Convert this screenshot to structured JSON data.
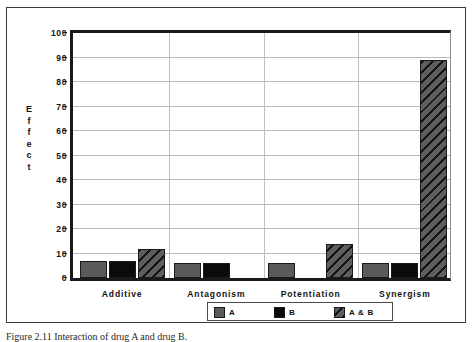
{
  "figure": {
    "caption": "Figure 2.11 Interaction of drug A and drug B."
  },
  "legend": {
    "position": "bottom-center",
    "items": [
      {
        "label": "A",
        "pattern": "solid-gray",
        "color": "#5a5a5a"
      },
      {
        "label": "B",
        "pattern": "solid-black",
        "color": "#0b0b0b"
      },
      {
        "label": "A & B",
        "pattern": "diagonal-hatch",
        "color": "#4a4a4a"
      }
    ]
  },
  "chart_data": {
    "type": "bar",
    "title": "",
    "xlabel": "",
    "ylabel": "Effect",
    "ylim": [
      0,
      100
    ],
    "yticks": [
      0,
      10,
      20,
      30,
      40,
      50,
      60,
      70,
      80,
      90,
      100
    ],
    "grid": true,
    "categories": [
      "Additive",
      "Antagonism",
      "Potentiation",
      "Synergism"
    ],
    "series": [
      {
        "name": "A",
        "values": [
          7,
          6,
          6,
          6
        ]
      },
      {
        "name": "B",
        "values": [
          7,
          6,
          0,
          6
        ]
      },
      {
        "name": "A & B",
        "values": [
          12,
          0,
          14,
          89
        ]
      }
    ]
  }
}
